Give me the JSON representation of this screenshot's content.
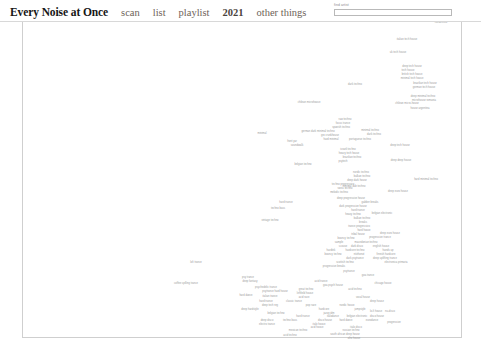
{
  "header": {
    "site_title": "Every Noise at Once",
    "nav": [
      {
        "label": "scan",
        "bold": false
      },
      {
        "label": "list",
        "bold": false
      },
      {
        "label": "playlist",
        "bold": false
      },
      {
        "label": "2021",
        "bold": true
      },
      {
        "label": "other things",
        "bold": false
      }
    ],
    "search": {
      "label": "find artist",
      "value": "",
      "placeholder": ""
    }
  },
  "chart_data": {
    "type": "scatter",
    "title": "Every Noise at Once",
    "xlabel": "",
    "ylabel": "",
    "xlim": [
      0,
      481
    ],
    "ylim": [
      0,
      329
    ],
    "grid": false,
    "legend": "none",
    "note": "Text-label scatter map of electronic music genres; each point is a genre name rendered as microscopic gray text at its embedding coordinates.",
    "points": [
      {
        "label": "deep tech house",
        "x": 418,
        "y": 9,
        "color": "#9a9a9a"
      },
      {
        "label": "nordestino",
        "x": 441,
        "y": 22,
        "color": "#9a9a9a"
      },
      {
        "label": "italian tech house",
        "x": 407,
        "y": 39,
        "color": "#9a9a9a"
      },
      {
        "label": "uk tech house",
        "x": 398,
        "y": 52,
        "color": "#9a9a9a"
      },
      {
        "label": "deep tech house",
        "x": 412,
        "y": 66,
        "color": "#9a9a9a"
      },
      {
        "label": "tech house",
        "x": 408,
        "y": 70,
        "color": "#9a9a9a"
      },
      {
        "label": "british tech house",
        "x": 412,
        "y": 74,
        "color": "#9a9a9a"
      },
      {
        "label": "minimal tech house",
        "x": 412,
        "y": 78,
        "color": "#9a9a9a"
      },
      {
        "label": "dark techno",
        "x": 355,
        "y": 84,
        "color": "#9a9a9a"
      },
      {
        "label": "brazilian tech house",
        "x": 425,
        "y": 83,
        "color": "#9a9a9a"
      },
      {
        "label": "german tech house",
        "x": 424,
        "y": 87,
        "color": "#9a9a9a"
      },
      {
        "label": "deep minimal techno",
        "x": 423,
        "y": 96,
        "color": "#9a9a9a"
      },
      {
        "label": "microhouse romania",
        "x": 424,
        "y": 100,
        "color": "#9a9a9a"
      },
      {
        "label": "chilean microhouse",
        "x": 309,
        "y": 102,
        "color": "#9a9a9a"
      },
      {
        "label": "chilean micro-house",
        "x": 407,
        "y": 103,
        "color": "#9a9a9a"
      },
      {
        "label": "house argentina",
        "x": 420,
        "y": 108,
        "color": "#9a9a9a"
      },
      {
        "label": "raw techno",
        "x": 345,
        "y": 119,
        "color": "#9a9a9a"
      },
      {
        "label": "focus trance",
        "x": 343,
        "y": 123,
        "color": "#9a9a9a"
      },
      {
        "label": "spanish techno",
        "x": 341,
        "y": 127,
        "color": "#9a9a9a"
      },
      {
        "label": "german dark minimal techno",
        "x": 318,
        "y": 131,
        "color": "#9a9a9a"
      },
      {
        "label": "minimal techno",
        "x": 370,
        "y": 130,
        "color": "#9a9a9a"
      },
      {
        "label": "minimal",
        "x": 262,
        "y": 133,
        "color": "#9a9a9a"
      },
      {
        "label": "gro crunkhouse",
        "x": 330,
        "y": 135,
        "color": "#9a9a9a"
      },
      {
        "label": "dark techno",
        "x": 374,
        "y": 134,
        "color": "#9a9a9a"
      },
      {
        "label": "hard minimal",
        "x": 331,
        "y": 139,
        "color": "#9a9a9a"
      },
      {
        "label": "portuguese techno",
        "x": 360,
        "y": 139,
        "color": "#9a9a9a"
      },
      {
        "label": "front yar",
        "x": 292,
        "y": 141,
        "color": "#9a9a9a"
      },
      {
        "label": "soundwalk",
        "x": 297,
        "y": 145,
        "color": "#9a9a9a"
      },
      {
        "label": "deep tech house",
        "x": 400,
        "y": 145,
        "color": "#9a9a9a"
      },
      {
        "label": "israeli techno",
        "x": 348,
        "y": 149,
        "color": "#9a9a9a"
      },
      {
        "label": "heavy tech house",
        "x": 349,
        "y": 153,
        "color": "#9a9a9a"
      },
      {
        "label": "brazilian techno",
        "x": 352,
        "y": 157,
        "color": "#9a9a9a"
      },
      {
        "label": "psytech",
        "x": 343,
        "y": 161,
        "color": "#9a9a9a"
      },
      {
        "label": "deep deep house",
        "x": 401,
        "y": 160,
        "color": "#9a9a9a"
      },
      {
        "label": "belgian techno",
        "x": 303,
        "y": 164,
        "color": "#9a9a9a"
      },
      {
        "label": "nordic techno",
        "x": 361,
        "y": 172,
        "color": "#9a9a9a"
      },
      {
        "label": "balkan techno",
        "x": 362,
        "y": 176,
        "color": "#9a9a9a"
      },
      {
        "label": "deep dark house",
        "x": 357,
        "y": 180,
        "color": "#9a9a9a"
      },
      {
        "label": "hard minimal techno",
        "x": 426,
        "y": 179,
        "color": "#9a9a9a"
      },
      {
        "label": "techno progressivo",
        "x": 343,
        "y": 184,
        "color": "#9a9a9a"
      },
      {
        "label": "swiss techno",
        "x": 345,
        "y": 188,
        "color": "#9a9a9a"
      },
      {
        "label": "minimal dub techno",
        "x": 354,
        "y": 186,
        "color": "#9a9a9a"
      },
      {
        "label": "melodic techno",
        "x": 339,
        "y": 192,
        "color": "#9a9a9a"
      },
      {
        "label": "deep euro house",
        "x": 398,
        "y": 191,
        "color": "#9a9a9a"
      },
      {
        "label": "deep progressive house",
        "x": 351,
        "y": 198,
        "color": "#9a9a9a"
      },
      {
        "label": "hard trance",
        "x": 286,
        "y": 202,
        "color": "#9a9a9a"
      },
      {
        "label": "gabber breaks",
        "x": 370,
        "y": 202,
        "color": "#9a9a9a"
      },
      {
        "label": "dark progressive house",
        "x": 353,
        "y": 206,
        "color": "#9a9a9a"
      },
      {
        "label": "techno bass",
        "x": 278,
        "y": 208,
        "color": "#9a9a9a"
      },
      {
        "label": "hard trance",
        "x": 358,
        "y": 210,
        "color": "#9a9a9a"
      },
      {
        "label": "heavy techno",
        "x": 353,
        "y": 214,
        "color": "#9a9a9a"
      },
      {
        "label": "belgian electronic",
        "x": 382,
        "y": 213,
        "color": "#9a9a9a"
      },
      {
        "label": "balkan techno",
        "x": 362,
        "y": 218,
        "color": "#9a9a9a"
      },
      {
        "label": "vintage techno",
        "x": 270,
        "y": 220,
        "color": "#9a9a9a"
      },
      {
        "label": "breaks",
        "x": 363,
        "y": 222,
        "color": "#9a9a9a"
      },
      {
        "label": "trance progressivo",
        "x": 359,
        "y": 226,
        "color": "#9a9a9a"
      },
      {
        "label": "hard house",
        "x": 364,
        "y": 230,
        "color": "#9a9a9a"
      },
      {
        "label": "tribal house",
        "x": 358,
        "y": 234,
        "color": "#9a9a9a"
      },
      {
        "label": "deep euro house",
        "x": 390,
        "y": 233,
        "color": "#9a9a9a"
      },
      {
        "label": "bouncy techno",
        "x": 346,
        "y": 238,
        "color": "#9a9a9a"
      },
      {
        "label": "progressive trance",
        "x": 380,
        "y": 237,
        "color": "#9a9a9a"
      },
      {
        "label": "sample",
        "x": 339,
        "y": 242,
        "color": "#9a9a9a"
      },
      {
        "label": "macedonian techno",
        "x": 366,
        "y": 242,
        "color": "#9a9a9a"
      },
      {
        "label": "scouse",
        "x": 343,
        "y": 246,
        "color": "#9a9a9a"
      },
      {
        "label": "dark disco",
        "x": 357,
        "y": 246,
        "color": "#9a9a9a"
      },
      {
        "label": "english house",
        "x": 381,
        "y": 246,
        "color": "#9a9a9a"
      },
      {
        "label": "hardtek",
        "x": 331,
        "y": 250,
        "color": "#9a9a9a"
      },
      {
        "label": "hardcore techno",
        "x": 355,
        "y": 250,
        "color": "#9a9a9a"
      },
      {
        "label": "hands up",
        "x": 388,
        "y": 250,
        "color": "#9a9a9a"
      },
      {
        "label": "bouncy techno",
        "x": 333,
        "y": 254,
        "color": "#9a9a9a"
      },
      {
        "label": "nitzhonot",
        "x": 359,
        "y": 254,
        "color": "#9a9a9a"
      },
      {
        "label": "finnish hardcore",
        "x": 386,
        "y": 254,
        "color": "#9a9a9a"
      },
      {
        "label": "dark psytrance",
        "x": 355,
        "y": 258,
        "color": "#9a9a9a"
      },
      {
        "label": "deep uplifting trance",
        "x": 385,
        "y": 258,
        "color": "#9a9a9a"
      },
      {
        "label": "electronica primaria",
        "x": 396,
        "y": 262,
        "color": "#9a9a9a"
      },
      {
        "label": "scottish techno",
        "x": 345,
        "y": 262,
        "color": "#9a9a9a"
      },
      {
        "label": "lofi trance",
        "x": 196,
        "y": 262,
        "color": "#9a9a9a"
      },
      {
        "label": "progressive breaks",
        "x": 334,
        "y": 266,
        "color": "#9a9a9a"
      },
      {
        "label": "psytrance",
        "x": 349,
        "y": 271,
        "color": "#9a9a9a"
      },
      {
        "label": "goa trance",
        "x": 368,
        "y": 275,
        "color": "#9a9a9a"
      },
      {
        "label": "coffee spilling trance",
        "x": 186,
        "y": 283,
        "color": "#9a9a9a"
      },
      {
        "label": "acid trance",
        "x": 321,
        "y": 281,
        "color": "#9a9a9a"
      },
      {
        "label": "goa psych house",
        "x": 333,
        "y": 285,
        "color": "#9a9a9a"
      },
      {
        "label": "chicago house",
        "x": 383,
        "y": 283,
        "color": "#9a9a9a"
      },
      {
        "label": "psy trance",
        "x": 248,
        "y": 277,
        "color": "#9a9a9a"
      },
      {
        "label": "deep fantasy",
        "x": 250,
        "y": 281,
        "color": "#9a9a9a"
      },
      {
        "label": "psychedelic trance",
        "x": 266,
        "y": 287,
        "color": "#9a9a9a"
      },
      {
        "label": "great techno",
        "x": 306,
        "y": 289,
        "color": "#9a9a9a"
      },
      {
        "label": "psytrance hard house",
        "x": 275,
        "y": 291,
        "color": "#9a9a9a"
      },
      {
        "label": "acid techno",
        "x": 355,
        "y": 289,
        "color": "#9a9a9a"
      },
      {
        "label": "leftfield house",
        "x": 305,
        "y": 293,
        "color": "#9a9a9a"
      },
      {
        "label": "hard dance",
        "x": 246,
        "y": 295,
        "color": "#9a9a9a"
      },
      {
        "label": "italian trance",
        "x": 270,
        "y": 296,
        "color": "#9a9a9a"
      },
      {
        "label": "acid rave",
        "x": 304,
        "y": 297,
        "color": "#9a9a9a"
      },
      {
        "label": "vocal house",
        "x": 363,
        "y": 297,
        "color": "#9a9a9a"
      },
      {
        "label": "classic trance",
        "x": 294,
        "y": 301,
        "color": "#9a9a9a"
      },
      {
        "label": "deep house",
        "x": 377,
        "y": 301,
        "color": "#9a9a9a"
      },
      {
        "label": "hard trance",
        "x": 266,
        "y": 301,
        "color": "#9a9a9a"
      },
      {
        "label": "deep tech nrg",
        "x": 270,
        "y": 305,
        "color": "#9a9a9a"
      },
      {
        "label": "pop rave",
        "x": 311,
        "y": 305,
        "color": "#9a9a9a"
      },
      {
        "label": "nordic house",
        "x": 347,
        "y": 305,
        "color": "#9a9a9a"
      },
      {
        "label": "deep hardstyle",
        "x": 250,
        "y": 309,
        "color": "#9a9a9a"
      },
      {
        "label": "hardcore",
        "x": 324,
        "y": 309,
        "color": "#9a9a9a"
      },
      {
        "label": "jumpstyle",
        "x": 360,
        "y": 309,
        "color": "#9a9a9a"
      },
      {
        "label": "belgian techno",
        "x": 276,
        "y": 313,
        "color": "#9a9a9a"
      },
      {
        "label": "jazzy idm",
        "x": 329,
        "y": 313,
        "color": "#9a9a9a"
      },
      {
        "label": "lo-fi house",
        "x": 376,
        "y": 311,
        "color": "#9a9a9a"
      },
      {
        "label": "nu-disco",
        "x": 390,
        "y": 311,
        "color": "#9a9a9a"
      },
      {
        "label": "italodance",
        "x": 333,
        "y": 316,
        "color": "#9a9a9a"
      },
      {
        "label": "hard trance",
        "x": 303,
        "y": 316,
        "color": "#9a9a9a"
      },
      {
        "label": "belgian electronic",
        "x": 357,
        "y": 316,
        "color": "#9a9a9a"
      },
      {
        "label": "disco house",
        "x": 377,
        "y": 316,
        "color": "#9a9a9a"
      },
      {
        "label": "deep disco",
        "x": 267,
        "y": 320,
        "color": "#9a9a9a"
      },
      {
        "label": "techno bass",
        "x": 290,
        "y": 320,
        "color": "#9a9a9a"
      },
      {
        "label": "disco house",
        "x": 325,
        "y": 320,
        "color": "#9a9a9a"
      },
      {
        "label": "hard dance",
        "x": 346,
        "y": 320,
        "color": "#9a9a9a"
      },
      {
        "label": "eurodance",
        "x": 372,
        "y": 320,
        "color": "#9a9a9a"
      },
      {
        "label": "electro trance",
        "x": 267,
        "y": 324,
        "color": "#9a9a9a"
      },
      {
        "label": "italo house",
        "x": 319,
        "y": 324,
        "color": "#9a9a9a"
      },
      {
        "label": "progressive",
        "x": 394,
        "y": 322,
        "color": "#9a9a9a"
      },
      {
        "label": "acid house",
        "x": 317,
        "y": 327,
        "color": "#9a9a9a"
      },
      {
        "label": "italo disco",
        "x": 356,
        "y": 327,
        "color": "#9a9a9a"
      },
      {
        "label": "mexican techno",
        "x": 298,
        "y": 330,
        "color": "#9a9a9a"
      },
      {
        "label": "russian techno",
        "x": 351,
        "y": 330,
        "color": "#9a9a9a"
      },
      {
        "label": "acid techno",
        "x": 290,
        "y": 335,
        "color": "#9a9a9a"
      },
      {
        "label": "south african deep house",
        "x": 345,
        "y": 334,
        "color": "#9a9a9a"
      },
      {
        "label": "afro house",
        "x": 354,
        "y": 338,
        "color": "#9a9a9a"
      }
    ]
  }
}
